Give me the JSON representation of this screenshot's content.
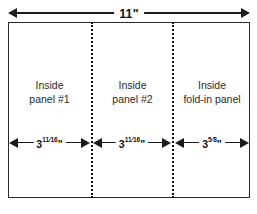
{
  "diagram": {
    "overall": {
      "label": "11\"",
      "name": "overall-width"
    },
    "panels": [
      {
        "label_line1": "Inside",
        "label_line2": "panel #1",
        "dimension": {
          "whole": "3",
          "numerator": "11",
          "denominator": "16",
          "unit": "\"",
          "text": "3 11/16\""
        }
      },
      {
        "label_line1": "Inside",
        "label_line2": "panel #2",
        "dimension": {
          "whole": "3",
          "numerator": "11",
          "denominator": "16",
          "unit": "\"",
          "text": "3 11/16\""
        }
      },
      {
        "label_line1": "Inside",
        "label_line2": "fold-in panel",
        "dimension": {
          "whole": "3",
          "numerator": "5",
          "denominator": "8",
          "unit": "\"",
          "text": "3 5/8\""
        }
      }
    ],
    "colors": {
      "line": "#2a2a2a",
      "fold": "#111111",
      "text": "#2b2b2b",
      "background": "#ffffff"
    }
  }
}
